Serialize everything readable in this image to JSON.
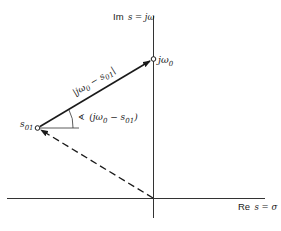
{
  "diagram": {
    "type": "s-plane vector diagram",
    "axes": {
      "imag_label_prefix": "Im",
      "imag_label_expr": "s = jω",
      "real_label_prefix": "Re",
      "real_label_expr": "s = σ"
    },
    "points": {
      "jw0": {
        "label_main": "jω",
        "label_sub": "0"
      },
      "s01": {
        "label_main": "s",
        "label_sub": "01"
      }
    },
    "vectors": {
      "magnitude_label": "|jω",
      "magnitude_label_sub": "0",
      "magnitude_label_rest": " − s",
      "magnitude_label_sub2": "01",
      "magnitude_label_end": "|",
      "angle_symbol": "∢",
      "angle_label_open": "(jω",
      "angle_label_sub": "0",
      "angle_label_mid": " − s",
      "angle_label_sub2": "01",
      "angle_label_close": ")"
    },
    "colors": {
      "line": "#1a1a1a",
      "background": "#ffffff"
    }
  }
}
